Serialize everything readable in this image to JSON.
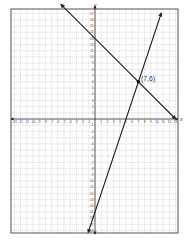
{
  "chart_data": {
    "type": "line",
    "title": "",
    "xlabel": "x",
    "ylabel": "y",
    "xlim": [
      -13.5,
      13.4
    ],
    "ylim": [
      -18.2,
      17.6
    ],
    "grid": true,
    "x_ticks": [
      -13,
      -12,
      -11,
      -10,
      -9,
      -8,
      -7,
      -6,
      -5,
      -4,
      -3,
      -2,
      -1,
      1,
      2,
      3,
      4,
      5,
      6,
      7,
      8,
      9,
      10,
      11,
      12,
      13
    ],
    "y_ticks": [
      17,
      16,
      15,
      14,
      13,
      12,
      11,
      10,
      9,
      8,
      7,
      6,
      5,
      4,
      3,
      2,
      1,
      -1,
      -2,
      -3,
      -4,
      -5,
      -6,
      -7,
      -8,
      -9,
      -10,
      -11,
      -12,
      -13,
      -14,
      -15,
      -16,
      -17,
      -18
    ],
    "series": [
      {
        "name": "line-1",
        "equation": "y = -x + 13",
        "slope": -1,
        "intercept": 13,
        "x": [
          -5.5,
          13
        ],
        "y": [
          18.5,
          0
        ]
      },
      {
        "name": "line-2",
        "equation": "y = 3x - 15",
        "slope": 3,
        "intercept": -15,
        "x": [
          -1.1,
          10.7
        ],
        "y": [
          -18.3,
          17.1
        ]
      }
    ],
    "annotations": [
      {
        "label": "(7,6)",
        "x": 7,
        "y": 6
      }
    ]
  },
  "labels": {
    "x_axis": "x",
    "y_axis": "y",
    "intersection": "(7,6)"
  }
}
